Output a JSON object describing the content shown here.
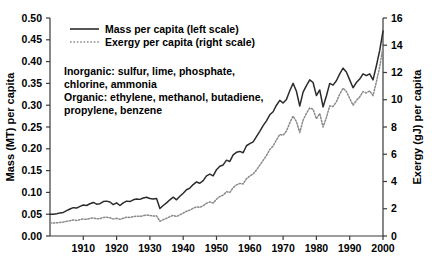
{
  "chart_data": {
    "type": "line",
    "title": "",
    "xlabel": "",
    "ylabel": "Mass (MT) per capita",
    "y2label": "Exergy (gJ) per capita",
    "xlim": [
      1900,
      2000
    ],
    "ylim": [
      0.0,
      0.5
    ],
    "y2lim": [
      0,
      16
    ],
    "grid": false,
    "legend_position": "top-left",
    "xticks": [
      1910,
      1920,
      1930,
      1940,
      1950,
      1960,
      1970,
      1980,
      1990,
      2000
    ],
    "xticklabels": [
      "1910",
      "1920",
      "1930",
      "1940",
      "1950",
      "1960",
      "1970",
      "1980",
      "1990",
      "2000"
    ],
    "yticks": [
      0.0,
      0.05,
      0.1,
      0.15,
      0.2,
      0.25,
      0.3,
      0.35,
      0.4,
      0.45,
      0.5
    ],
    "yticklabels": [
      "0.00",
      "0.05",
      "0.10",
      "0.15",
      "0.20",
      "0.25",
      "0.30",
      "0.35",
      "0.40",
      "0.45",
      "0.50"
    ],
    "y2ticks": [
      0,
      2,
      4,
      6,
      8,
      10,
      12,
      14,
      16
    ],
    "y2ticklabels": [
      "0",
      "2",
      "4",
      "6",
      "8",
      "10",
      "12",
      "14",
      "16"
    ],
    "x": [
      1900,
      1901,
      1902,
      1903,
      1904,
      1905,
      1906,
      1907,
      1908,
      1909,
      1910,
      1911,
      1912,
      1913,
      1914,
      1915,
      1916,
      1917,
      1918,
      1919,
      1920,
      1921,
      1922,
      1923,
      1924,
      1925,
      1926,
      1927,
      1928,
      1929,
      1930,
      1931,
      1932,
      1933,
      1934,
      1935,
      1936,
      1937,
      1938,
      1939,
      1940,
      1941,
      1942,
      1943,
      1944,
      1945,
      1946,
      1947,
      1948,
      1949,
      1950,
      1951,
      1952,
      1953,
      1954,
      1955,
      1956,
      1957,
      1958,
      1959,
      1960,
      1961,
      1962,
      1963,
      1964,
      1965,
      1966,
      1967,
      1968,
      1969,
      1970,
      1971,
      1972,
      1973,
      1974,
      1975,
      1976,
      1977,
      1978,
      1979,
      1980,
      1981,
      1982,
      1983,
      1984,
      1985,
      1986,
      1987,
      1988,
      1989,
      1990,
      1991,
      1992,
      1993,
      1994,
      1995,
      1996,
      1997,
      1998,
      1999,
      2000
    ],
    "series": [
      {
        "name": "Mass per capita (left scale)",
        "axis": "left",
        "style": "solid",
        "color": "#2b2b2b",
        "values": [
          0.05,
          0.05,
          0.051,
          0.053,
          0.054,
          0.058,
          0.062,
          0.065,
          0.064,
          0.068,
          0.071,
          0.07,
          0.074,
          0.077,
          0.073,
          0.074,
          0.079,
          0.08,
          0.078,
          0.072,
          0.076,
          0.07,
          0.076,
          0.08,
          0.079,
          0.083,
          0.085,
          0.084,
          0.087,
          0.089,
          0.086,
          0.085,
          0.086,
          0.063,
          0.07,
          0.076,
          0.083,
          0.089,
          0.083,
          0.091,
          0.098,
          0.106,
          0.11,
          0.118,
          0.124,
          0.121,
          0.127,
          0.138,
          0.142,
          0.138,
          0.152,
          0.16,
          0.163,
          0.174,
          0.171,
          0.186,
          0.192,
          0.194,
          0.191,
          0.207,
          0.212,
          0.216,
          0.228,
          0.24,
          0.253,
          0.264,
          0.278,
          0.285,
          0.3,
          0.311,
          0.305,
          0.313,
          0.333,
          0.35,
          0.332,
          0.298,
          0.33,
          0.345,
          0.358,
          0.352,
          0.322,
          0.335,
          0.296,
          0.321,
          0.35,
          0.346,
          0.356,
          0.372,
          0.385,
          0.376,
          0.358,
          0.34,
          0.352,
          0.36,
          0.372,
          0.368,
          0.372,
          0.358,
          0.39,
          0.425,
          0.47
        ]
      },
      {
        "name": "Exergy per capita (right scale)",
        "axis": "right",
        "style": "dotted",
        "color": "#8a8a8a",
        "values": [
          0.95,
          0.95,
          0.97,
          1.0,
          1.02,
          1.08,
          1.12,
          1.18,
          1.14,
          1.2,
          1.25,
          1.22,
          1.28,
          1.33,
          1.26,
          1.28,
          1.36,
          1.38,
          1.34,
          1.24,
          1.3,
          1.22,
          1.3,
          1.38,
          1.36,
          1.42,
          1.46,
          1.44,
          1.49,
          1.54,
          1.5,
          1.46,
          1.48,
          1.08,
          1.2,
          1.3,
          1.42,
          1.52,
          1.42,
          1.56,
          1.68,
          1.82,
          1.9,
          2.04,
          2.14,
          2.1,
          2.22,
          2.4,
          2.5,
          2.42,
          2.7,
          2.9,
          3.0,
          3.25,
          3.2,
          3.55,
          3.75,
          3.85,
          3.82,
          4.2,
          4.4,
          4.55,
          4.85,
          5.2,
          5.55,
          5.9,
          6.35,
          6.6,
          7.05,
          7.45,
          7.4,
          7.7,
          8.3,
          8.8,
          8.4,
          7.6,
          8.5,
          9.0,
          9.4,
          9.3,
          8.6,
          9.0,
          8.0,
          8.7,
          9.55,
          9.5,
          9.85,
          10.4,
          10.85,
          10.6,
          10.1,
          9.6,
          9.95,
          10.2,
          10.6,
          10.5,
          10.65,
          10.3,
          11.3,
          12.4,
          13.9
        ]
      }
    ],
    "annotations": [
      "Inorganic: sulfur, lime, phosphate,",
      "chlorine, ammonia",
      "Organic: ethylene, methanol, butadiene,",
      "propylene, benzene"
    ]
  }
}
